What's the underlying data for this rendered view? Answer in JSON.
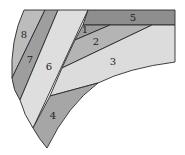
{
  "diagram": {
    "type": "region-partition",
    "regions": [
      {
        "id": "1",
        "label": "1",
        "fill": "#9c9c9c"
      },
      {
        "id": "2",
        "label": "2",
        "fill": "#b4b4b4"
      },
      {
        "id": "3",
        "label": "3",
        "fill": "#dcdcdc"
      },
      {
        "id": "4",
        "label": "4",
        "fill": "#a6a6a6"
      },
      {
        "id": "5",
        "label": "5",
        "fill": "#8e8e8e"
      },
      {
        "id": "6",
        "label": "6",
        "fill": "#dedede"
      },
      {
        "id": "7",
        "label": "7",
        "fill": "#9e9e9e"
      },
      {
        "id": "8",
        "label": "8",
        "fill": "#bcbcbc"
      }
    ]
  }
}
